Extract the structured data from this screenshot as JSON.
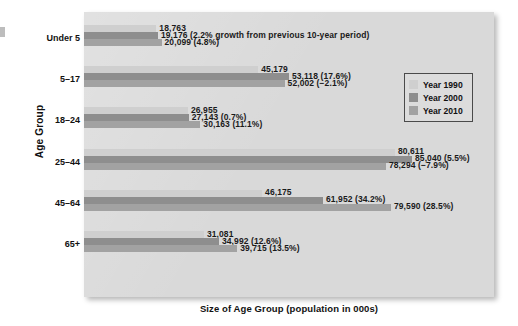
{
  "chart_data": {
    "type": "bar",
    "orientation": "horizontal",
    "title": "",
    "xlabel": "Size of Age Group (population in 000s)",
    "ylabel": "Age Group",
    "grid": false,
    "legend_position": "top-right-inside",
    "xlim": [
      0,
      85040
    ],
    "categories": [
      "Under 5",
      "5–17",
      "18–24",
      "25–44",
      "45–64",
      "65+"
    ],
    "series": [
      {
        "name": "Year 1990",
        "color": "#cfcfcf",
        "values": [
          18763,
          45179,
          26955,
          80611,
          46175,
          31081
        ],
        "labels": [
          "18,763",
          "45,179",
          "26,955",
          "80,611",
          "46,175",
          "31,081"
        ]
      },
      {
        "name": "Year 2000",
        "color": "#8e8e8e",
        "values": [
          19176,
          53118,
          27143,
          85040,
          61952,
          34992
        ],
        "labels": [
          "19,176 (2.2% growth from previous 10-year period)",
          "53,118 (17.6%)",
          "27,143 (0.7%)",
          "85,040 (5.5%)",
          "61,952 (34.2%)",
          "34,992 (12.6%)"
        ]
      },
      {
        "name": "Year 2010",
        "color": "#a2a2a2",
        "values": [
          20099,
          52002,
          30163,
          78294,
          79590,
          39715
        ],
        "labels": [
          "20,099 (4.8%)",
          "52,002 (−2.1%)",
          "30,163 (11.1%)",
          "78,294 (−7.9%)",
          "79,590 (28.5%)",
          "39,715 (13.5%)"
        ]
      }
    ],
    "annotations": [
      "2.2% growth from previous 10-year period"
    ]
  },
  "legend": {
    "items": [
      {
        "label": "Year 1990",
        "color": "#cfcfcf"
      },
      {
        "label": "Year 2000",
        "color": "#8e8e8e"
      },
      {
        "label": "Year 2010",
        "color": "#a2a2a2"
      }
    ]
  },
  "colors": {
    "panel_background": "#d9d9d9",
    "page_background": "#ffffff",
    "text": "#111111",
    "legend_border": "#4a4a4a"
  }
}
